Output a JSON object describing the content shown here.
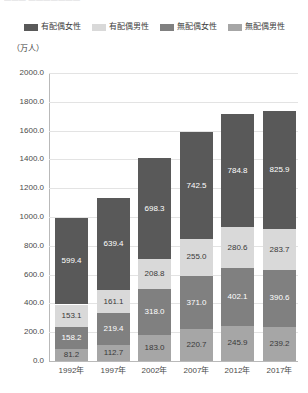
{
  "header": {
    "cropped_text": "———   ———————"
  },
  "legend": {
    "position": "top-center",
    "items": [
      {
        "label": "有配偶女性",
        "color": "#595959"
      },
      {
        "label": "有配偶男性",
        "color": "#d9d9d9"
      },
      {
        "label": "無配偶女性",
        "color": "#808080"
      },
      {
        "label": "無配偶男性",
        "color": "#a6a6a6"
      }
    ]
  },
  "axis": {
    "unit_label": "（万人）",
    "y_ticks": [
      "2000.0",
      "1800.0",
      "1600.0",
      "1400.0",
      "1200.0",
      "1000.0",
      "800.0",
      "600.0",
      "400.0",
      "200.0",
      "0.0"
    ],
    "x_ticks": [
      "1992年",
      "1997年",
      "2002年",
      "2007年",
      "2012年",
      "2017年"
    ]
  },
  "chart_data": {
    "type": "bar",
    "stacked": true,
    "title": "",
    "xlabel": "",
    "ylabel": "（万人）",
    "ylim": [
      0,
      2000
    ],
    "ytick_step": 200,
    "grid": true,
    "legend_position": "top-center",
    "categories": [
      "1992年",
      "1997年",
      "2002年",
      "2007年",
      "2012年",
      "2017年"
    ],
    "stack_order_bottom_to_top": [
      "無配偶男性",
      "無配偶女性",
      "有配偶男性",
      "有配偶女性"
    ],
    "series": [
      {
        "name": "無配偶男性",
        "color": "#a6a6a6",
        "label_color": "dark",
        "values": [
          81.2,
          112.7,
          183.0,
          220.7,
          245.9,
          239.2
        ],
        "labels": [
          "81.2",
          "112.7",
          "183.0",
          "220.7",
          "245.9",
          "239.2"
        ]
      },
      {
        "name": "無配偶女性",
        "color": "#808080",
        "label_color": "light",
        "values": [
          158.2,
          219.4,
          318.0,
          371.0,
          402.1,
          390.6
        ],
        "labels": [
          "158.2",
          "219.4",
          "318.0",
          "371.0",
          "402.1",
          "390.6"
        ]
      },
      {
        "name": "有配偶男性",
        "color": "#d9d9d9",
        "label_color": "dark",
        "values": [
          153.1,
          161.1,
          208.8,
          255.0,
          280.6,
          283.7
        ],
        "labels": [
          "153.1",
          "161.1",
          "208.8",
          "255.0",
          "280.6",
          "283.7"
        ]
      },
      {
        "name": "有配偶女性",
        "color": "#595959",
        "label_color": "light",
        "values": [
          599.4,
          639.4,
          698.3,
          742.5,
          784.8,
          825.9
        ],
        "labels": [
          "599.4",
          "639.4",
          "698.3",
          "742.5",
          "784.8",
          "825.9"
        ]
      }
    ],
    "totals": [
      991.9,
      1132.6,
      1408.1,
      1589.2,
      1713.4,
      1739.4
    ]
  }
}
